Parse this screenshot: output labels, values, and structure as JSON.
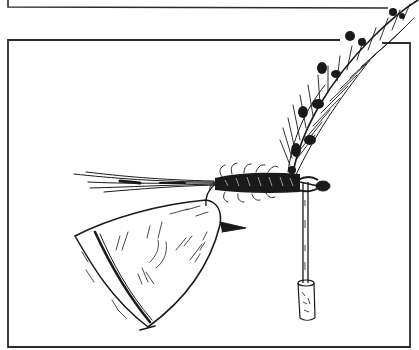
{
  "illustration": {
    "subject": "fly-tying-illustration",
    "style": "black ink line art on white",
    "colors": {
      "ink": "#1a1a1a",
      "paper": "#ffffff",
      "frame": "#333333"
    },
    "elements": [
      "upper-frame-edge",
      "main-frame",
      "wing-feather",
      "tail-fibers",
      "hackle-body",
      "hook-eye",
      "dubbing-needle",
      "needle-handle",
      "cone-shaped-tool"
    ]
  }
}
